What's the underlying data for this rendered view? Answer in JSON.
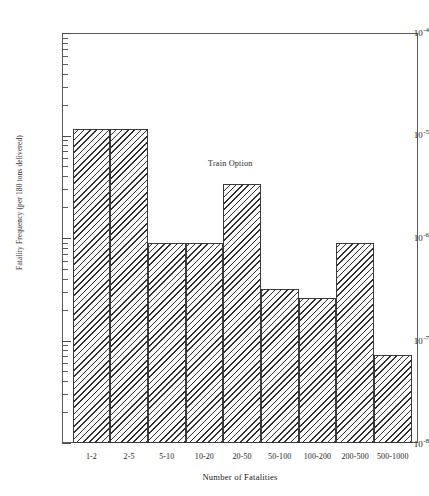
{
  "figure": {
    "top_caption": "",
    "annotation": "Train Option"
  },
  "chart_data": {
    "type": "bar",
    "title": "",
    "annotations": [
      "Train Option"
    ],
    "categories": [
      "1-2",
      "2-5",
      "5-10",
      "10-20",
      "20-50",
      "50-100",
      "100-200",
      "200-500",
      "500-1000"
    ],
    "values": [
      1.15e-05,
      1.15e-05,
      9e-07,
      9e-07,
      3.4e-06,
      3.2e-07,
      2.6e-07,
      9e-07,
      7.3e-08
    ],
    "value_labels": [
      "1.15e-5",
      "1.15e-5",
      "9.0e-7",
      "9.0e-7",
      "3.4e-6",
      "3.2e-7",
      "2.6e-7",
      "9.0e-7",
      "7.3e-8"
    ],
    "xlabel": "Number of Fatalities",
    "ylabel": "Fatality Frequency (per 180 tons delivered)",
    "yscale": "log",
    "ylim": [
      1e-08,
      0.0001
    ],
    "y_tick_labels": [
      "10-4",
      "10-5",
      "10-6",
      "10-7",
      "10-8"
    ],
    "y_tick_mantissa": "10",
    "y_tick_exponents": [
      "-4",
      "-5",
      "-6",
      "-7",
      "-8"
    ],
    "grid": false,
    "legend": null,
    "bar_style": "diagonal-hatch",
    "colors": {
      "hatch": "#2b2b2b",
      "bar_fill": "#ffffff",
      "bar_edge": "#3a3a3a",
      "axis": "#5a5a5a",
      "text": "#1a1a1a"
    }
  },
  "axis": {
    "y_labels": [
      {
        "mantissa": "10",
        "exponent": "-4"
      },
      {
        "mantissa": "10",
        "exponent": "-5"
      },
      {
        "mantissa": "10",
        "exponent": "-6"
      },
      {
        "mantissa": "10",
        "exponent": "-7"
      },
      {
        "mantissa": "10",
        "exponent": "-8"
      }
    ],
    "y_title": "Fatality Frequency (per 180 tons delivered)",
    "x_title": "Number of Fatalities",
    "x_labels": [
      "1-2",
      "2-5",
      "5-10",
      "10-20",
      "20-50",
      "50-100",
      "100-200",
      "200-500",
      "500-1000"
    ]
  }
}
